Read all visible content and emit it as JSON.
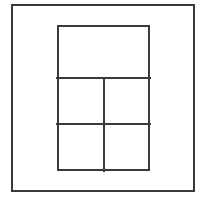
{
  "figure": {
    "canvas": {
      "width": 209,
      "height": 201,
      "background_color": "#ffffff"
    },
    "style": {
      "stroke_color": "#3a3a3a",
      "outer_stroke_width": 2,
      "inner_stroke_width": 2,
      "divider_stroke_width": 2
    },
    "shapes": {
      "outer_rectangle": {
        "label": "outer border rectangle",
        "x": 11,
        "y": 4,
        "width": 184,
        "height": 188
      },
      "inner_rectangle": {
        "label": "inner panel rectangle",
        "x": 57,
        "y": 25,
        "width": 93,
        "height": 146
      },
      "horizontal_divider_upper": {
        "label": "upper horizontal divider",
        "x1": 57,
        "y1": 78,
        "x2": 150,
        "y2": 78
      },
      "horizontal_divider_lower": {
        "label": "lower horizontal divider",
        "x1": 57,
        "y1": 124,
        "x2": 150,
        "y2": 124
      },
      "vertical_divider": {
        "label": "vertical divider",
        "x1": 104,
        "y1": 78,
        "x2": 104,
        "y2": 171
      }
    },
    "cells": [
      {
        "name": "top-cell",
        "row": 1,
        "column": 0,
        "x": 57,
        "y": 25,
        "width": 93,
        "height": 53
      },
      {
        "name": "middle-left-cell",
        "row": 2,
        "column": 1,
        "x": 57,
        "y": 78,
        "width": 47,
        "height": 46
      },
      {
        "name": "middle-right-cell",
        "row": 2,
        "column": 2,
        "x": 104,
        "y": 78,
        "width": 46,
        "height": 46
      },
      {
        "name": "bottom-left-cell",
        "row": 3,
        "column": 1,
        "x": 57,
        "y": 124,
        "width": 47,
        "height": 47
      },
      {
        "name": "bottom-right-cell",
        "row": 3,
        "column": 2,
        "x": 104,
        "y": 124,
        "width": 46,
        "height": 47
      }
    ]
  }
}
